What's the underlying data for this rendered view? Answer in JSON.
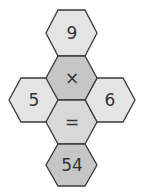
{
  "puzzle": {
    "cells": [
      {
        "id": "top",
        "label": "9",
        "fill": "#e4e4e4",
        "cx": 72,
        "cy": 33
      },
      {
        "id": "operator",
        "label": "×",
        "fill": "#c6c6c6",
        "cx": 72,
        "cy": 78
      },
      {
        "id": "left",
        "label": "5",
        "fill": "#e4e4e4",
        "cx": 34,
        "cy": 100
      },
      {
        "id": "right",
        "label": "6",
        "fill": "#e4e4e4",
        "cx": 110,
        "cy": 100
      },
      {
        "id": "equals",
        "label": "=",
        "fill": "#d8d8d8",
        "cx": 72,
        "cy": 122
      },
      {
        "id": "result",
        "label": "54",
        "fill": "#c6c6c6",
        "cx": 72,
        "cy": 164
      }
    ]
  }
}
